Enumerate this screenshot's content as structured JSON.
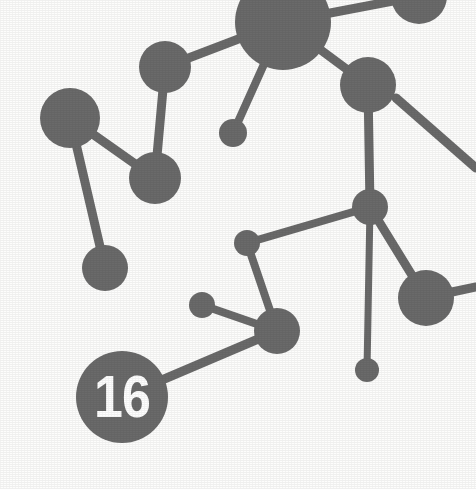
{
  "figure": {
    "badge_label": "16",
    "node_color": "#6a6a6a",
    "edge_color": "#6a6a6a",
    "background_color": "#fdfdfc",
    "badge_text_color": "#ffffff",
    "canvas": {
      "width": 476,
      "height": 489
    }
  },
  "chart_data": {
    "type": "scatter",
    "xlabel": "",
    "ylabel": "",
    "xlim": [
      0,
      476
    ],
    "ylim": [
      0,
      489
    ],
    "grid": false,
    "legend": null,
    "nodes": [
      {
        "id": "n1",
        "name": "top-large-node",
        "x": 283,
        "y": 22,
        "r": 48
      },
      {
        "id": "n2",
        "name": "top-right-edge-node",
        "x": 419,
        "y": -4,
        "r": 28
      },
      {
        "id": "n3",
        "name": "upper-left-node",
        "x": 165,
        "y": 67,
        "r": 26
      },
      {
        "id": "n4",
        "name": "left-node",
        "x": 70,
        "y": 118,
        "r": 30
      },
      {
        "id": "n5",
        "name": "upper-mid-small-node",
        "x": 233,
        "y": 133,
        "r": 14
      },
      {
        "id": "n6",
        "name": "mid-left-node",
        "x": 155,
        "y": 178,
        "r": 26
      },
      {
        "id": "n7",
        "name": "upper-right-node",
        "x": 368,
        "y": 85,
        "r": 28
      },
      {
        "id": "n8",
        "name": "lower-left-node",
        "x": 105,
        "y": 268,
        "r": 23
      },
      {
        "id": "n9",
        "name": "center-junction-node",
        "x": 370,
        "y": 207,
        "r": 18
      },
      {
        "id": "n10",
        "name": "mid-small-node",
        "x": 247,
        "y": 243,
        "r": 13
      },
      {
        "id": "n11",
        "name": "right-node",
        "x": 426,
        "y": 298,
        "r": 28
      },
      {
        "id": "n12",
        "name": "lower-small-node",
        "x": 202,
        "y": 305,
        "r": 13
      },
      {
        "id": "n13",
        "name": "lower-mid-node",
        "x": 277,
        "y": 331,
        "r": 23
      },
      {
        "id": "n14",
        "name": "bottom-small-node",
        "x": 367,
        "y": 370,
        "r": 12
      },
      {
        "id": "n15",
        "name": "badge-node-16",
        "x": 122,
        "y": 397,
        "r": 46
      }
    ],
    "edges": [
      {
        "from": "n3",
        "to": "n1",
        "width": 9
      },
      {
        "from": "n1",
        "to": "n2",
        "width": 9
      },
      {
        "from": "n1",
        "to": "n7",
        "width": 9
      },
      {
        "from": "n1",
        "to": "n5",
        "width": 8
      },
      {
        "from": "n3",
        "to": "n6",
        "width": 9
      },
      {
        "from": "n4",
        "to": "n6",
        "width": 9
      },
      {
        "from": "n4",
        "to": "n8",
        "width": 9
      },
      {
        "from": "n7",
        "to": "n9",
        "width": 9
      },
      {
        "from": "n9",
        "to": "n10",
        "width": 8
      },
      {
        "from": "n9",
        "to": "n11",
        "width": 9
      },
      {
        "from": "n9",
        "to": "n14",
        "width": 7
      },
      {
        "from": "n10",
        "to": "n13",
        "width": 8
      },
      {
        "from": "n13",
        "to": "n12",
        "width": 8
      },
      {
        "from": "n13",
        "to": "n15",
        "width": 9
      }
    ],
    "open_edges": [
      {
        "name": "right-edge-stub-from-n7",
        "x1": 396,
        "y1": 98,
        "x2": 476,
        "y2": 168,
        "width": 9
      },
      {
        "name": "right-edge-stub-from-n11",
        "x1": 452,
        "y1": 292,
        "x2": 476,
        "y2": 287,
        "width": 9
      }
    ]
  }
}
